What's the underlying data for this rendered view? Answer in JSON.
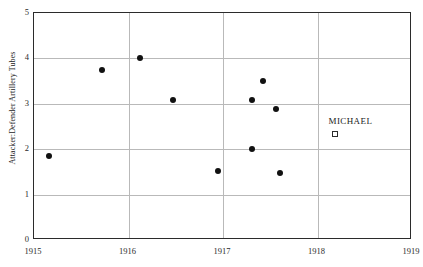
{
  "chart_data": {
    "type": "scatter",
    "title": "",
    "xlabel": "",
    "ylabel": "Attacker:Defender Artillery Tubes",
    "xlim": [
      1915,
      1919
    ],
    "ylim": [
      0,
      5
    ],
    "grid": true,
    "x_ticks": [
      "1915",
      "1916",
      "1917",
      "1918",
      "1919"
    ],
    "x_tick_values": [
      1915,
      1916,
      1917,
      1918,
      1919
    ],
    "y_ticks": [
      "0",
      "1",
      "2",
      "3",
      "4",
      "5"
    ],
    "y_tick_values": [
      0,
      1,
      2,
      3,
      4,
      5
    ],
    "series": [
      {
        "name": "battles",
        "marker": "filled-circle",
        "color": "#111111",
        "points": [
          {
            "x": 1915.16,
            "y": 1.85
          },
          {
            "x": 1915.72,
            "y": 3.75
          },
          {
            "x": 1916.12,
            "y": 4.0
          },
          {
            "x": 1916.47,
            "y": 3.08
          },
          {
            "x": 1916.95,
            "y": 1.53
          },
          {
            "x": 1917.31,
            "y": 3.08
          },
          {
            "x": 1917.31,
            "y": 2.0
          },
          {
            "x": 1917.42,
            "y": 3.5
          },
          {
            "x": 1917.56,
            "y": 2.88
          },
          {
            "x": 1917.6,
            "y": 1.47
          }
        ]
      }
    ],
    "legend": {
      "position": "inside-right",
      "entries": [
        {
          "label": "MICHAEL",
          "marker": "open-square",
          "color": "#2b2b2b",
          "x": 1918.18,
          "y": 2.33
        }
      ]
    },
    "colors": {
      "point": "#111111",
      "frame": "#2b2b2b",
      "grid": "#b9b9b9",
      "background": "#ffffff",
      "text": "#1a1a1a"
    }
  }
}
